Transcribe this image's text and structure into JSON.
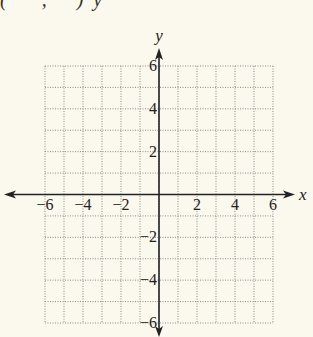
{
  "header_fragment": "(       ,      )  y",
  "chart_data": {
    "type": "scatter",
    "title": "",
    "xlabel": "x",
    "ylabel": "y",
    "xlim": [
      -6,
      6
    ],
    "ylim": [
      -6,
      6
    ],
    "grid": true,
    "grid_style": "dotted",
    "grid_step": 1,
    "x_ticks": [
      -6,
      -4,
      -2,
      2,
      4,
      6
    ],
    "y_ticks": [
      -6,
      -4,
      -2,
      2,
      4,
      6
    ],
    "x_tick_labels": [
      "−6",
      "−4",
      "−2",
      "2",
      "4",
      "6"
    ],
    "y_tick_labels": [
      "−6",
      "−4",
      "−2",
      "2",
      "4",
      "6"
    ],
    "series": [],
    "points": []
  },
  "colors": {
    "background": "#fbf8ee",
    "axis": "#222222",
    "grid": "#8a8a8a",
    "text": "#222222"
  }
}
